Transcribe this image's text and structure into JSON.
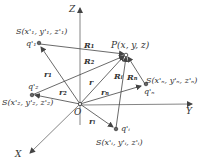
{
  "diagram": {
    "axes": {
      "z_label": "Z",
      "y_label": "Y",
      "x_label": "X",
      "origin_label": "O"
    },
    "field_point": {
      "label": "P(x, y, z)"
    },
    "charges": [
      {
        "name": "q1",
        "charge_label": "q'₁",
        "coord_label": "S(x'₁, y'₁, z'₁)",
        "position_vector": "r₁",
        "distance_vector": "R₁"
      },
      {
        "name": "q2",
        "charge_label": "q'₂",
        "coord_label": "S(x'₂, y'₂, z'₂)",
        "position_vector": "r₂",
        "distance_vector": "R₂"
      },
      {
        "name": "qi",
        "charge_label": "q'ᵢ",
        "coord_label": "S(x'ᵢ, y'ᵢ, z'ᵢ)",
        "position_vector": "rᵢ",
        "distance_vector": "Rᵢ"
      },
      {
        "name": "qn",
        "charge_label": "q'ₙ",
        "coord_label": "S(x'ₙ, y'ₙ, z'ₙ)",
        "position_vector": "rₙ",
        "distance_vector": "Rₙ"
      }
    ],
    "field_position_vector": "r",
    "colors": {
      "line": "#555555",
      "text": "#333333",
      "background": "#ffffff"
    }
  }
}
